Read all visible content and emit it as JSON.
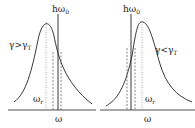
{
  "panels": [
    {
      "id": "left",
      "condition": "γ>γ",
      "condition_sub": "T",
      "top_label": "hω",
      "top_label_sub": "0",
      "peak_label": "ω",
      "peak_label_sub": "r",
      "axis_label": "ω"
    },
    {
      "id": "right",
      "condition": "γ<γ",
      "condition_sub": "T",
      "top_label": "hω",
      "top_label_sub": "0",
      "peak_label": "ω",
      "peak_label_sub": "r",
      "axis_label": "ω"
    }
  ],
  "colors": {
    "line": "#222222",
    "dotted": "#777777",
    "background": "#ffffff"
  }
}
